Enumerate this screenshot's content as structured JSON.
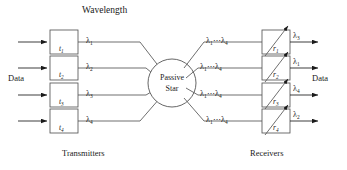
{
  "figure": {
    "title": "Wavelength",
    "left_caption": "Transmitters",
    "right_caption": "Receivers",
    "left_data_label": "Data",
    "right_data_label": "Data",
    "hub_line1": "Passive",
    "hub_line2": "Star",
    "broadcast_label_prefix": "λ",
    "broadcast_label_dots": "⋯",
    "line_color": "#555555",
    "text_color": "#1a1a1a",
    "background": "#ffffff"
  },
  "transmitters": [
    {
      "id": "t",
      "index": "1",
      "wavelength": "λ",
      "wavelength_index": "1"
    },
    {
      "id": "t",
      "index": "2",
      "wavelength": "λ",
      "wavelength_index": "2"
    },
    {
      "id": "t",
      "index": "3",
      "wavelength": "λ",
      "wavelength_index": "3"
    },
    {
      "id": "t",
      "index": "4",
      "wavelength": "λ",
      "wavelength_index": "4"
    }
  ],
  "receivers": [
    {
      "id": "r",
      "index": "1",
      "in_first": "λ",
      "in_first_index": "1",
      "in_last": "λ",
      "in_last_index": "4",
      "out": "λ",
      "out_index": "3"
    },
    {
      "id": "r",
      "index": "2",
      "in_first": "λ",
      "in_first_index": "1",
      "in_last": "λ",
      "in_last_index": "4",
      "out": "λ",
      "out_index": "1"
    },
    {
      "id": "r",
      "index": "3",
      "in_first": "λ",
      "in_first_index": "1",
      "in_last": "λ",
      "in_last_index": "4",
      "out": "λ",
      "out_index": "4"
    },
    {
      "id": "r",
      "index": "4",
      "in_first": "λ",
      "in_first_index": "1",
      "in_last": "λ",
      "in_last_index": "4",
      "out": "λ",
      "out_index": "2"
    }
  ]
}
